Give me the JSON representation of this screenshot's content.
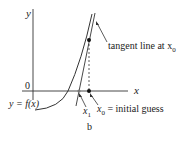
{
  "diagram": {
    "axis_x_label": "x",
    "axis_y_label": "y",
    "origin_label": "0",
    "curve_label": "y = f(x)",
    "tangent_label": "tangent line at x",
    "tangent_label_sub": "0",
    "x1_label": "x",
    "x1_sub": "1",
    "x0_label": "x",
    "x0_sub": "0",
    "x0_desc": " = initial guess",
    "caption": "b"
  }
}
